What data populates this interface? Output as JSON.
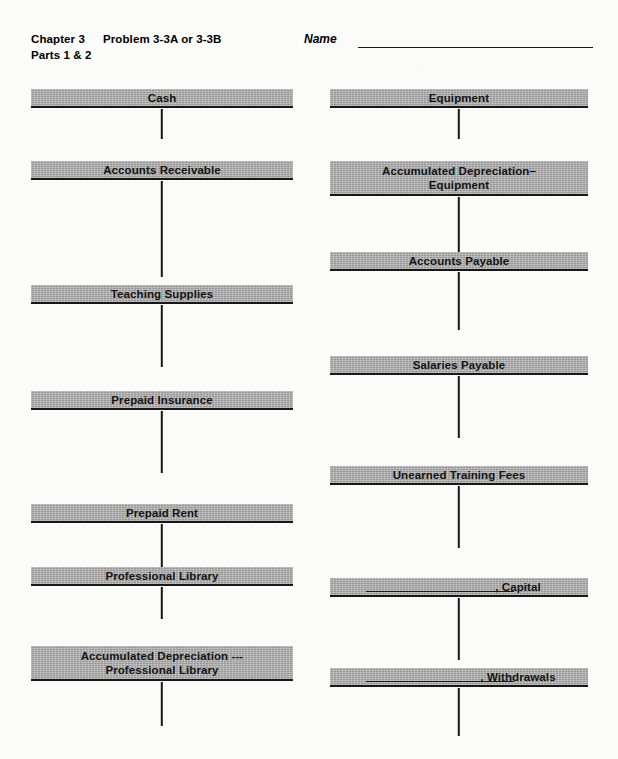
{
  "header": {
    "chapter": "Chapter 3",
    "problem": "Problem 3-3A or 3-3B",
    "parts": "Parts 1 & 2",
    "name_label": "Name",
    "name_value": ""
  },
  "colors": {
    "bar_gray": "#a6a6a6",
    "rule_black": "#171717",
    "page_background": "#fbfbfa"
  },
  "worksheet": {
    "left_column": [
      {
        "name": "Cash",
        "lines": 1,
        "top": 89,
        "stem": 30
      },
      {
        "name": "Accounts Receivable",
        "lines": 1,
        "top": 161,
        "stem": 96
      },
      {
        "name": "Teaching Supplies",
        "lines": 1,
        "top": 285,
        "stem": 62
      },
      {
        "name": "Prepaid Insurance",
        "lines": 1,
        "top": 391,
        "stem": 62
      },
      {
        "name": "Prepaid Rent",
        "lines": 1,
        "top": 504,
        "stem": 44
      },
      {
        "name": "Professional Library",
        "lines": 1,
        "top": 567,
        "stem": 32
      },
      {
        "name": "Accumulated Depreciation ---\nProfessional Library",
        "lines": 2,
        "top": 646,
        "stem": 44
      }
    ],
    "right_column": [
      {
        "name": "Equipment",
        "lines": 1,
        "top": 89,
        "stem": 30,
        "blank": false
      },
      {
        "name": "Accumulated Depreciation–\nEquipment",
        "lines": 2,
        "top": 161,
        "stem": 60,
        "blank": false
      },
      {
        "name": "Accounts Payable",
        "lines": 1,
        "top": 252,
        "stem": 58,
        "blank": false
      },
      {
        "name": "Salaries Payable",
        "lines": 1,
        "top": 356,
        "stem": 62,
        "blank": false
      },
      {
        "name": "Unearned Training Fees",
        "lines": 1,
        "top": 466,
        "stem": 62,
        "blank": false
      },
      {
        "name": ", Capital",
        "lines": 1,
        "top": 578,
        "stem": 62,
        "blank": true
      },
      {
        "name": ", Withdrawals",
        "lines": 1,
        "top": 668,
        "stem": 48,
        "blank": true
      }
    ]
  }
}
